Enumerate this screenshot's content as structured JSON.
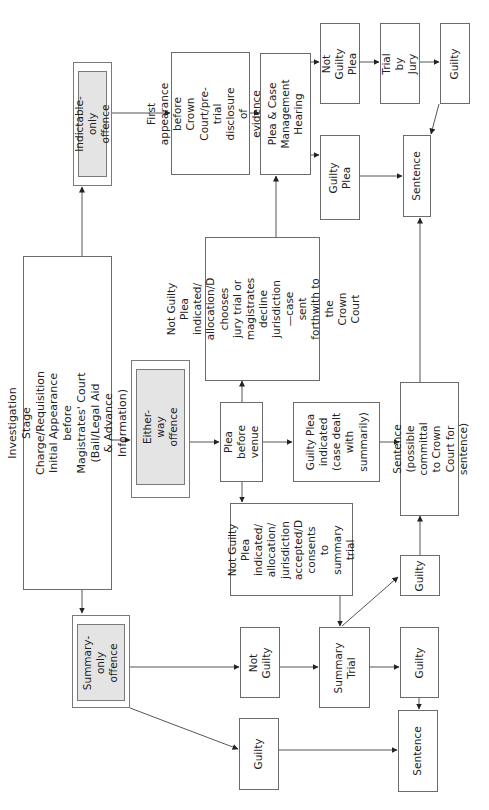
{
  "diagram": {
    "orientation": "rotated 90deg counter-clockwise; read with page turned",
    "nodes": {
      "investigation": "Investigation Stage\nCharge/Requisition\nInitial Appearance before\nMagistrates' Court (Bail/Legal Aid\n& Advance Information)",
      "indictable_only": "Indictable-only\noffence",
      "first_appearance": "First appearance\nbefore Crown\nCourt/pre-trial\ndisclosure of\nevidence ordered",
      "plea_case_mgmt": "Plea & Case\nManagement\nHearing",
      "not_guilty_plea_crown": "Not Guilty\nPlea",
      "trial_by_jury": "Trial by\nJury",
      "guilty_crown": "Guilty",
      "guilty_plea_crown": "Guilty Plea",
      "sentence_crown": "Sentence",
      "ng_plea_sent_crown": "Not Guilty Plea indicated/\nallocation/D\nchooses jury trial or\nmagistrates\ndecline jurisdiction—case\nsent forthwith to the\nCrown Court",
      "either_way": "Either-way offence",
      "plea_before_venue": "Plea before\nvenue",
      "guilty_plea_indicated": "Guilty Plea\nindicated\n(case dealt\nwith\nsummarily)",
      "sentence_committal": "Sentence (possible\ncommittal to Crown\nCourt for sentence)",
      "ng_plea_summary": "Not Guilty Plea\nindicated/\nallocation/\njurisdiction\naccepted/D\nconsents to\nsummary trial",
      "guilty_after_ng_summary": "Guilty",
      "summary_only": "Summary-\nonly offence",
      "not_guilty_summary": "Not\nGuilty",
      "summary_trial": "Summary\nTrial",
      "guilty_summary_trial": "Guilty",
      "guilty_summary_only": "Guilty",
      "sentence_magistrates": "Sentence"
    },
    "edges": [
      [
        "investigation",
        "indictable_only"
      ],
      [
        "investigation",
        "either_way"
      ],
      [
        "investigation",
        "summary_only"
      ],
      [
        "indictable_only",
        "first_appearance"
      ],
      [
        "first_appearance",
        "plea_case_mgmt"
      ],
      [
        "plea_case_mgmt",
        "not_guilty_plea_crown"
      ],
      [
        "plea_case_mgmt",
        "guilty_plea_crown"
      ],
      [
        "not_guilty_plea_crown",
        "trial_by_jury"
      ],
      [
        "trial_by_jury",
        "guilty_crown"
      ],
      [
        "guilty_crown",
        "sentence_crown"
      ],
      [
        "guilty_plea_crown",
        "sentence_crown"
      ],
      [
        "either_way",
        "plea_before_venue"
      ],
      [
        "plea_before_venue",
        "ng_plea_sent_crown"
      ],
      [
        "plea_before_venue",
        "guilty_plea_indicated"
      ],
      [
        "plea_before_venue",
        "ng_plea_summary"
      ],
      [
        "ng_plea_sent_crown",
        "plea_case_mgmt"
      ],
      [
        "guilty_plea_indicated",
        "sentence_committal"
      ],
      [
        "sentence_committal",
        "sentence_crown"
      ],
      [
        "ng_plea_summary",
        "summary_trial"
      ],
      [
        "summary_trial",
        "guilty_after_ng_summary"
      ],
      [
        "guilty_after_ng_summary",
        "sentence_committal"
      ],
      [
        "summary_only",
        "not_guilty_summary"
      ],
      [
        "summary_only",
        "guilty_summary_only"
      ],
      [
        "not_guilty_summary",
        "summary_trial"
      ],
      [
        "summary_trial",
        "guilty_summary_trial"
      ],
      [
        "guilty_summary_trial",
        "sentence_magistrates"
      ],
      [
        "guilty_summary_only",
        "sentence_magistrates"
      ]
    ],
    "colors": {
      "line": "#555555",
      "box_border": "#6b6b6b",
      "offence_fill": "#e4e4e4"
    }
  }
}
